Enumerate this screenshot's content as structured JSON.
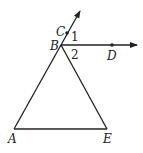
{
  "diagram": {
    "type": "geometry",
    "points": {
      "A": {
        "label": "A",
        "x": 14,
        "y": 129
      },
      "B": {
        "label": "B",
        "x": 61,
        "y": 45
      },
      "C": {
        "label": "C",
        "x": 67,
        "y": 33
      },
      "D": {
        "label": "D",
        "x": 112,
        "y": 45
      },
      "E": {
        "label": "E",
        "x": 107,
        "y": 129
      }
    },
    "angles": {
      "angle1": {
        "label": "1"
      },
      "angle2": {
        "label": "2"
      }
    },
    "rays": [
      "BC",
      "BD"
    ],
    "segments": [
      "AB",
      "BE",
      "AE"
    ],
    "line_color": "#222222"
  }
}
